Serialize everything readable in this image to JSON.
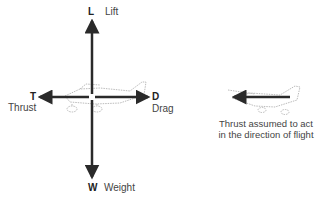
{
  "forces": {
    "lift": {
      "symbol": "L",
      "name": "Lift"
    },
    "thrust": {
      "symbol": "T",
      "name": "Thrust"
    },
    "drag": {
      "symbol": "D",
      "name": "Drag"
    },
    "weight": {
      "symbol": "W",
      "name": "Weight"
    }
  },
  "caption": {
    "line1": "Thrust assumed to act",
    "line2": "in the direction of flight"
  },
  "colors": {
    "arrow": "#2a2a2a",
    "aircraft_outline": "#aaaaaa"
  }
}
